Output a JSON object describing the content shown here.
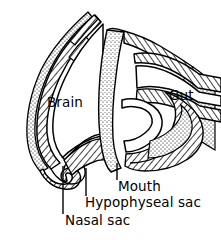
{
  "figure": {
    "background_color": "#ffffff",
    "ink_color": "#000000",
    "width": 221,
    "height": 243
  },
  "labels": {
    "brain": "Brain",
    "gut": "Gut",
    "mouth": "Mouth",
    "hypophyseal_sac": "Hypophyseal sac",
    "nasal_sac": "Nasal sac"
  },
  "leader_lines": [
    {
      "name": "nasal-sac-leader",
      "x": 63,
      "y_top": 166,
      "y_bottom": 214
    },
    {
      "name": "hypophyseal-sac-leader",
      "x": 86,
      "y_top": 168,
      "y_bottom": 196
    },
    {
      "name": "mouth-leader",
      "x": 117,
      "y_top": 163,
      "y_bottom": 180
    }
  ],
  "regions": [
    {
      "name": "brain-wall",
      "texture": "hatched",
      "label": "Brain"
    },
    {
      "name": "brain-outer-layer",
      "texture": "stippled",
      "label": ""
    },
    {
      "name": "hypophyseal-column",
      "texture": "stippled",
      "label": "Hypophyseal sac"
    },
    {
      "name": "gut-wall",
      "texture": "hatched",
      "label": "Gut"
    },
    {
      "name": "mouth-cavity",
      "texture": "blank",
      "label": "Mouth"
    },
    {
      "name": "nasal-sac-curl",
      "texture": "hatched",
      "label": "Nasal sac"
    }
  ]
}
